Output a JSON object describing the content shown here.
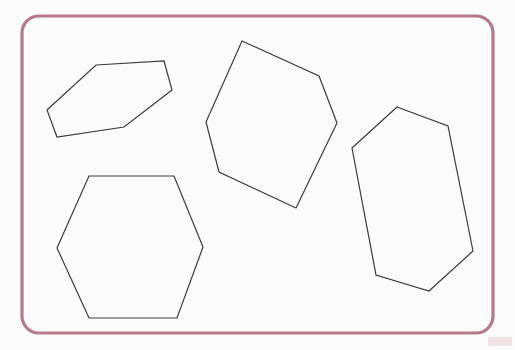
{
  "canvas": {
    "width": 515,
    "height": 350,
    "background_color": "#ffffff",
    "description": "Geometry worksheet showing four irregular hexagon outlines inside a rounded rectangular frame"
  },
  "frame": {
    "name": "rounded-rectangle-border",
    "x": 22,
    "y": 16,
    "width": 471,
    "height": 317,
    "corner_radius": 17,
    "stroke_color": "#b5798a",
    "stroke_width": 3.2,
    "fill": "none"
  },
  "shapes": {
    "stroke_color": "#3a3a3f",
    "stroke_width": 1.2,
    "fill": "none",
    "count": 4,
    "items": [
      {
        "id": "shape-1",
        "label": "elongated-hexagon-top-left",
        "sides": 6,
        "points": "96,65 164,61 172,90 124,127 57,137 47,110"
      },
      {
        "id": "shape-2",
        "label": "large-hexagon-center",
        "sides": 6,
        "points": "242,41 319,76 337,123 296,208 219,172 206,122"
      },
      {
        "id": "shape-3",
        "label": "regular-hexagon-bottom-left",
        "sides": 6,
        "points": "89,176 174,176 203,247 177,318 89,318 57,248"
      },
      {
        "id": "shape-4",
        "label": "tall-hexagon-right",
        "sides": 6,
        "points": "397,107 448,126 473,251 429,291 376,275 352,148"
      }
    ]
  },
  "artifacts": {
    "corner_smudge": {
      "name": "pink-scan-smudge",
      "x": 488,
      "y": 337,
      "width": 24,
      "height": 9,
      "color": "#d8a7b4"
    }
  }
}
